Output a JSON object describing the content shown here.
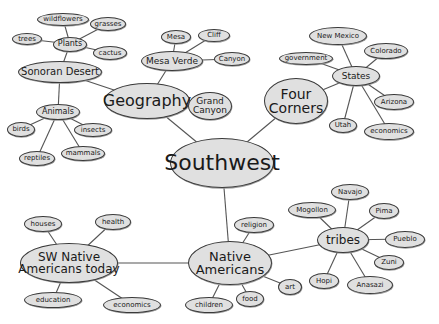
{
  "diagram": {
    "type": "mind-map",
    "colors": {
      "node_fill": "#e0e0e0",
      "node_border": "#3a3a3a",
      "line": "#555555",
      "background": "#ffffff"
    },
    "nodes": [
      {
        "id": "southwest",
        "label": "Southwest",
        "x": 222,
        "y": 163,
        "w": 104,
        "h": 50,
        "fs": 22
      },
      {
        "id": "geography",
        "label": "Geography",
        "x": 147,
        "y": 101,
        "w": 86,
        "h": 36,
        "fs": 16
      },
      {
        "id": "sonoran",
        "label": "Sonoran Desert",
        "x": 60,
        "y": 72,
        "w": 84,
        "h": 22,
        "fs": 10
      },
      {
        "id": "plants",
        "label": "Plants",
        "x": 70,
        "y": 44,
        "w": 34,
        "h": 15,
        "fs": 8
      },
      {
        "id": "wildflowers",
        "label": "wildflowers",
        "x": 63,
        "y": 19,
        "w": 52,
        "h": 13,
        "fs": 7
      },
      {
        "id": "grasses",
        "label": "grasses",
        "x": 108,
        "y": 24,
        "w": 36,
        "h": 14,
        "fs": 7
      },
      {
        "id": "trees",
        "label": "trees",
        "x": 27,
        "y": 39,
        "w": 30,
        "h": 12,
        "fs": 7
      },
      {
        "id": "cactus",
        "label": "cactus",
        "x": 110,
        "y": 53,
        "w": 34,
        "h": 14,
        "fs": 7
      },
      {
        "id": "animals",
        "label": "Animals",
        "x": 58,
        "y": 112,
        "w": 44,
        "h": 16,
        "fs": 8
      },
      {
        "id": "birds",
        "label": "birds",
        "x": 21,
        "y": 129,
        "w": 28,
        "h": 15,
        "fs": 7
      },
      {
        "id": "insects",
        "label": "insects",
        "x": 93,
        "y": 130,
        "w": 38,
        "h": 14,
        "fs": 7
      },
      {
        "id": "reptiles",
        "label": "reptiles",
        "x": 37,
        "y": 158,
        "w": 36,
        "h": 15,
        "fs": 7
      },
      {
        "id": "mammals",
        "label": "mammals",
        "x": 83,
        "y": 153,
        "w": 44,
        "h": 15,
        "fs": 7
      },
      {
        "id": "mesaverde",
        "label": "Mesa Verde",
        "x": 172,
        "y": 61,
        "w": 62,
        "h": 20,
        "fs": 9
      },
      {
        "id": "mesa",
        "label": "Mesa",
        "x": 176,
        "y": 37,
        "w": 30,
        "h": 14,
        "fs": 7
      },
      {
        "id": "cliff",
        "label": "Cliff",
        "x": 214,
        "y": 35,
        "w": 32,
        "h": 13,
        "fs": 7
      },
      {
        "id": "canyon",
        "label": "Canyon",
        "x": 232,
        "y": 59,
        "w": 36,
        "h": 14,
        "fs": 7
      },
      {
        "id": "grandcanyon",
        "label": "Grand\nCanyon",
        "x": 210,
        "y": 106,
        "w": 44,
        "h": 28,
        "fs": 9
      },
      {
        "id": "fourcorners",
        "label": "Four\nCorners",
        "x": 296,
        "y": 101,
        "w": 64,
        "h": 46,
        "fs": 14
      },
      {
        "id": "states",
        "label": "States",
        "x": 356,
        "y": 76,
        "w": 48,
        "h": 20,
        "fs": 9
      },
      {
        "id": "newmexico",
        "label": "New Mexico",
        "x": 338,
        "y": 36,
        "w": 58,
        "h": 18,
        "fs": 7
      },
      {
        "id": "colorado",
        "label": "Colorado",
        "x": 386,
        "y": 51,
        "w": 44,
        "h": 16,
        "fs": 7
      },
      {
        "id": "government",
        "label": "government",
        "x": 306,
        "y": 58,
        "w": 54,
        "h": 13,
        "fs": 7
      },
      {
        "id": "arizona",
        "label": "Arizona",
        "x": 394,
        "y": 102,
        "w": 40,
        "h": 16,
        "fs": 7
      },
      {
        "id": "utah",
        "label": "Utah",
        "x": 343,
        "y": 125,
        "w": 28,
        "h": 15,
        "fs": 7
      },
      {
        "id": "economics1",
        "label": "economics",
        "x": 389,
        "y": 131,
        "w": 50,
        "h": 17,
        "fs": 7
      },
      {
        "id": "nativeamericans",
        "label": "Native\nAmericans",
        "x": 230,
        "y": 263,
        "w": 84,
        "h": 44,
        "fs": 13
      },
      {
        "id": "religion",
        "label": "religion",
        "x": 254,
        "y": 225,
        "w": 40,
        "h": 16,
        "fs": 7
      },
      {
        "id": "children",
        "label": "children",
        "x": 209,
        "y": 305,
        "w": 48,
        "h": 16,
        "fs": 7
      },
      {
        "id": "food",
        "label": "food",
        "x": 250,
        "y": 299,
        "w": 28,
        "h": 16,
        "fs": 7
      },
      {
        "id": "art",
        "label": "art",
        "x": 290,
        "y": 287,
        "w": 24,
        "h": 16,
        "fs": 7
      },
      {
        "id": "tribes",
        "label": "tribes",
        "x": 343,
        "y": 240,
        "w": 52,
        "h": 26,
        "fs": 12
      },
      {
        "id": "navajo",
        "label": "Navajo",
        "x": 350,
        "y": 192,
        "w": 38,
        "h": 16,
        "fs": 7
      },
      {
        "id": "mogollon",
        "label": "Mogollon",
        "x": 312,
        "y": 210,
        "w": 48,
        "h": 16,
        "fs": 7
      },
      {
        "id": "pima",
        "label": "Pima",
        "x": 384,
        "y": 211,
        "w": 30,
        "h": 16,
        "fs": 7
      },
      {
        "id": "pueblo",
        "label": "Pueblo",
        "x": 405,
        "y": 239,
        "w": 40,
        "h": 17,
        "fs": 7
      },
      {
        "id": "zuni",
        "label": "Zuni",
        "x": 389,
        "y": 262,
        "w": 30,
        "h": 15,
        "fs": 7
      },
      {
        "id": "hopi",
        "label": "Hopi",
        "x": 324,
        "y": 281,
        "w": 30,
        "h": 16,
        "fs": 7
      },
      {
        "id": "anasazi",
        "label": "Anasazi",
        "x": 370,
        "y": 285,
        "w": 46,
        "h": 18,
        "fs": 7
      },
      {
        "id": "swtoday",
        "label": "SW Native\nAmericans today",
        "x": 69,
        "y": 263,
        "w": 98,
        "h": 40,
        "fs": 12
      },
      {
        "id": "houses",
        "label": "houses",
        "x": 43,
        "y": 224,
        "w": 38,
        "h": 16,
        "fs": 7
      },
      {
        "id": "health",
        "label": "health",
        "x": 113,
        "y": 222,
        "w": 36,
        "h": 16,
        "fs": 7
      },
      {
        "id": "education",
        "label": "education",
        "x": 53,
        "y": 300,
        "w": 58,
        "h": 16,
        "fs": 7
      },
      {
        "id": "economics2",
        "label": "economics",
        "x": 132,
        "y": 305,
        "w": 58,
        "h": 16,
        "fs": 7
      }
    ],
    "edges": [
      [
        "southwest",
        "geography"
      ],
      [
        "southwest",
        "fourcorners"
      ],
      [
        "southwest",
        "nativeamericans"
      ],
      [
        "geography",
        "sonoran"
      ],
      [
        "geography",
        "mesaverde"
      ],
      [
        "geography",
        "grandcanyon"
      ],
      [
        "sonoran",
        "plants"
      ],
      [
        "sonoran",
        "animals"
      ],
      [
        "plants",
        "wildflowers"
      ],
      [
        "plants",
        "grasses"
      ],
      [
        "plants",
        "trees"
      ],
      [
        "plants",
        "cactus"
      ],
      [
        "animals",
        "birds"
      ],
      [
        "animals",
        "insects"
      ],
      [
        "animals",
        "reptiles"
      ],
      [
        "animals",
        "mammals"
      ],
      [
        "mesaverde",
        "mesa"
      ],
      [
        "mesaverde",
        "cliff"
      ],
      [
        "mesaverde",
        "canyon"
      ],
      [
        "fourcorners",
        "states"
      ],
      [
        "states",
        "newmexico"
      ],
      [
        "states",
        "colorado"
      ],
      [
        "states",
        "government"
      ],
      [
        "states",
        "arizona"
      ],
      [
        "states",
        "utah"
      ],
      [
        "states",
        "economics1"
      ],
      [
        "nativeamericans",
        "religion"
      ],
      [
        "nativeamericans",
        "children"
      ],
      [
        "nativeamericans",
        "food"
      ],
      [
        "nativeamericans",
        "art"
      ],
      [
        "nativeamericans",
        "tribes"
      ],
      [
        "nativeamericans",
        "swtoday"
      ],
      [
        "tribes",
        "navajo"
      ],
      [
        "tribes",
        "mogollon"
      ],
      [
        "tribes",
        "pima"
      ],
      [
        "tribes",
        "pueblo"
      ],
      [
        "tribes",
        "zuni"
      ],
      [
        "tribes",
        "hopi"
      ],
      [
        "tribes",
        "anasazi"
      ],
      [
        "swtoday",
        "houses"
      ],
      [
        "swtoday",
        "health"
      ],
      [
        "swtoday",
        "education"
      ],
      [
        "swtoday",
        "economics2"
      ]
    ]
  }
}
